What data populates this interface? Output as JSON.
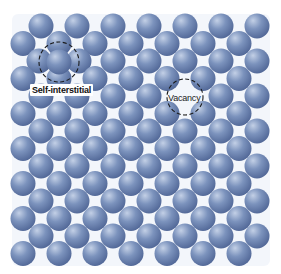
{
  "figure": {
    "background": "#ffffff",
    "gap_tint": "#e9eff7",
    "sphere": {
      "radius": 12.5,
      "color_highlight": "#c3d0e6",
      "color_mid": "#7c93bd",
      "color_edge": "#4f6595"
    },
    "lattice": {
      "rows": 14,
      "row_start_y": 26,
      "row_step_y": 17.5,
      "even_row_start_x": 41,
      "odd_row_start_x": 23,
      "col_step_x": 36,
      "cols_per_row": 7
    },
    "defects": [
      {
        "type": "self-interstitial",
        "label": "Self-interstitial",
        "circle": {
          "cx": 59,
          "cy": 62,
          "r": 20
        },
        "extra_atom": {
          "x": 59,
          "y": 62
        },
        "displaced_atoms": [
          {
            "row": 2,
            "col": 0,
            "dx": -2,
            "dy": 0
          },
          {
            "row": 2,
            "col": 1,
            "dx": 2,
            "dy": 0
          }
        ]
      },
      {
        "type": "vacancy",
        "label": "Vacancy",
        "circle": {
          "cx": 185,
          "cy": 97,
          "r": 18
        },
        "missing_atom": {
          "row": 4,
          "col": 4
        }
      }
    ],
    "circle_style": {
      "stroke": "#1a1a1a",
      "stroke_width": 1.1,
      "dash": "4 2.5"
    }
  }
}
